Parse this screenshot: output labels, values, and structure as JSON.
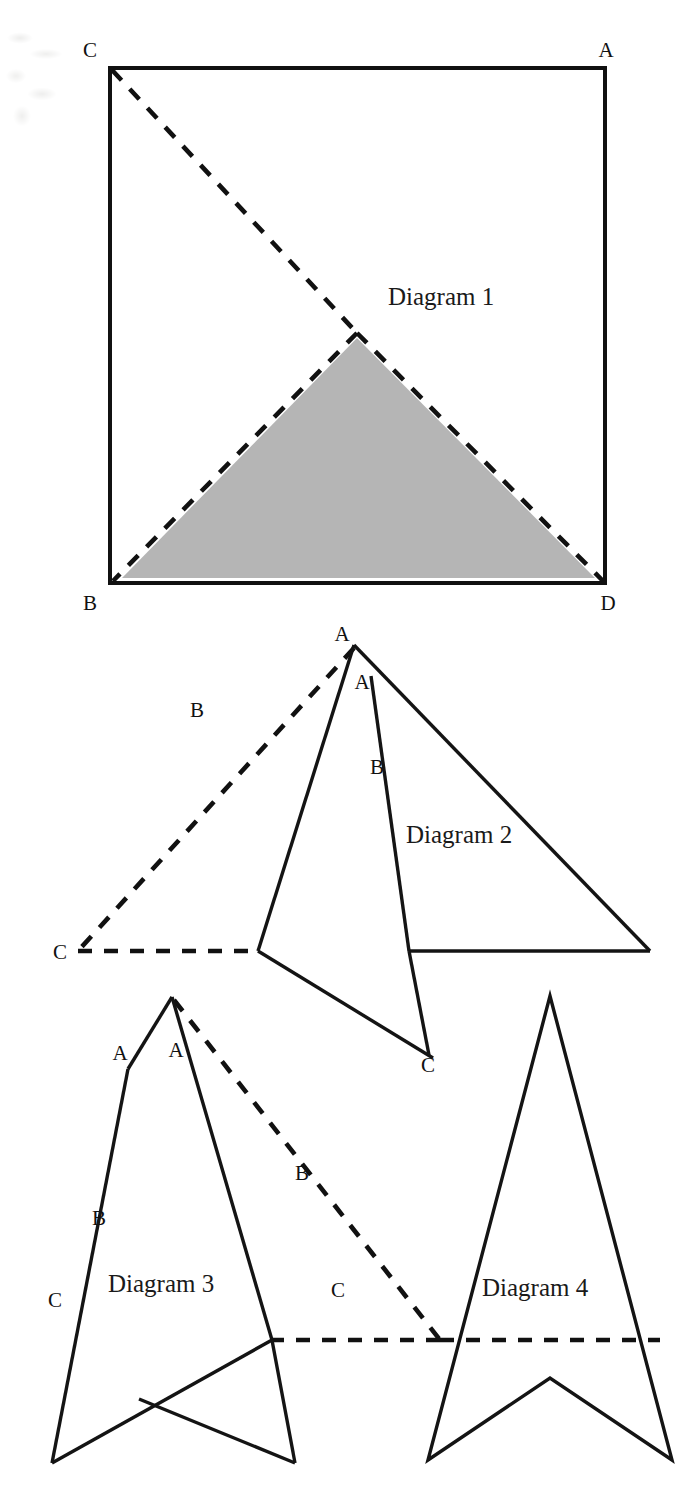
{
  "page": {
    "width": 698,
    "height": 1501,
    "background_color": "#ffffff",
    "ink_color": "#111111",
    "shade_color": "#b5b5b5"
  },
  "diagrams": [
    {
      "id": "diagram-1",
      "caption": "Diagram 1",
      "caption_pos": {
        "x": 388,
        "y": 305
      },
      "description": "Square with vertices labelled C (top-left), A (top-right), B (bottom-left), D (bottom-right); a dashed triangle C-B-D overlaid with a shaded solid triangle whose apex is the midpoint of the square.",
      "square": {
        "x1": 110,
        "y1": 68,
        "x2": 605,
        "y2": 583
      },
      "shaded_triangle": [
        {
          "x": 357,
          "y": 338
        },
        {
          "x": 122,
          "y": 578
        },
        {
          "x": 595,
          "y": 578
        }
      ],
      "dashed_segments": [
        {
          "x1": 112,
          "y1": 70,
          "x2": 357,
          "y2": 333
        },
        {
          "x1": 357,
          "y1": 333,
          "x2": 113,
          "y2": 581
        },
        {
          "x1": 357,
          "y1": 333,
          "x2": 603,
          "y2": 581
        }
      ],
      "labels": [
        {
          "text": "C",
          "x": 90,
          "y": 57
        },
        {
          "text": "A",
          "x": 606,
          "y": 57
        },
        {
          "text": "B",
          "x": 90,
          "y": 610
        },
        {
          "text": "D",
          "x": 608,
          "y": 610
        }
      ]
    },
    {
      "id": "diagram-2",
      "caption": "Diagram 2",
      "caption_pos": {
        "x": 406,
        "y": 843
      },
      "description": "A dashed triangle with apex A at top, long dashed side through B down to C at lower-left, and a horizontal dashed base; overlapping solid arrow/triangle outlines with a second apex A, point B on its left edge and vertex C at bottom.",
      "dashed_segments": [
        {
          "x1": 354,
          "y1": 648,
          "x2": 78,
          "y2": 951
        },
        {
          "x1": 78,
          "y1": 951,
          "x2": 258,
          "y2": 951
        }
      ],
      "solid_segments": [
        {
          "x1": 354,
          "y1": 645,
          "x2": 258,
          "y2": 951
        },
        {
          "x1": 258,
          "y1": 951,
          "x2": 433,
          "y2": 1058
        },
        {
          "x1": 354,
          "y1": 645,
          "x2": 650,
          "y2": 951
        },
        {
          "x1": 650,
          "y1": 951,
          "x2": 409,
          "y2": 951
        },
        {
          "x1": 371,
          "y1": 676,
          "x2": 409,
          "y2": 951
        },
        {
          "x1": 409,
          "y1": 951,
          "x2": 429,
          "y2": 1055
        }
      ],
      "labels": [
        {
          "text": "A",
          "x": 342,
          "y": 641
        },
        {
          "text": "A",
          "x": 362,
          "y": 689
        },
        {
          "text": "B",
          "x": 197,
          "y": 717
        },
        {
          "text": "B",
          "x": 377,
          "y": 774
        },
        {
          "text": "C",
          "x": 60,
          "y": 959
        },
        {
          "text": "C",
          "x": 428,
          "y": 1072
        }
      ]
    },
    {
      "id": "diagram-3",
      "caption": "Diagram 3",
      "caption_pos": {
        "x": 108,
        "y": 1292
      },
      "description": "Solid five-point arrow outline with apex at top, labelled A on left edge, B lower on left edge, C at bottom-left; a dashed triangle shares the apex, runs through B on the right and down to C, with a horizontal dashed base.",
      "dashed_segments": [
        {
          "x1": 174,
          "y1": 1000,
          "x2": 440,
          "y2": 1340
        },
        {
          "x1": 440,
          "y1": 1340,
          "x2": 272,
          "y2": 1340
        }
      ],
      "solid_segments": [
        {
          "x1": 172,
          "y1": 997,
          "x2": 128,
          "y2": 1069
        },
        {
          "x1": 128,
          "y1": 1069,
          "x2": 52,
          "y2": 1463
        },
        {
          "x1": 52,
          "y1": 1463,
          "x2": 272,
          "y2": 1340
        },
        {
          "x1": 272,
          "y1": 1340,
          "x2": 295,
          "y2": 1463
        },
        {
          "x1": 295,
          "y1": 1463,
          "x2": 139,
          "y2": 1399
        },
        {
          "x1": 172,
          "y1": 997,
          "x2": 272,
          "y2": 1340
        }
      ],
      "labels": [
        {
          "text": "A",
          "x": 120,
          "y": 1060
        },
        {
          "text": "A",
          "x": 176,
          "y": 1057
        },
        {
          "text": "B",
          "x": 99,
          "y": 1225
        },
        {
          "text": "B",
          "x": 302,
          "y": 1180
        },
        {
          "text": "C",
          "x": 55,
          "y": 1307
        },
        {
          "text": "C",
          "x": 338,
          "y": 1297
        }
      ]
    },
    {
      "id": "diagram-4",
      "caption": "Diagram 4",
      "caption_pos": {
        "x": 482,
        "y": 1296
      },
      "description": "Symmetric solid arrow/chevron outline with apex at top, notch at bottom centre, and a horizontal dashed line crossing it.",
      "dashed_segments": [
        {
          "x1": 440,
          "y1": 1340,
          "x2": 660,
          "y2": 1340
        }
      ],
      "solid_polygon": [
        {
          "x": 550,
          "y": 996
        },
        {
          "x": 672,
          "y": 1460
        },
        {
          "x": 550,
          "y": 1378
        },
        {
          "x": 428,
          "y": 1460
        }
      ],
      "labels": []
    }
  ]
}
